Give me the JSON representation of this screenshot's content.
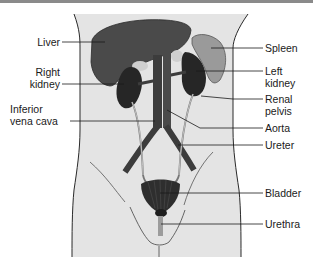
{
  "diagram": {
    "type": "anatomical-diagram",
    "colors": {
      "background": "#ffffff",
      "body_fill": "#e4e4e4",
      "outline": "#2a2a2a",
      "liver": "#4a4a4a",
      "kidney": "#262626",
      "spleen": "#9a9a9a",
      "vessel": "#3c3c3c",
      "bladder": "#2e2e2e",
      "urethra": "#9c9c9c",
      "leader_line": "#1a1a1a",
      "text": "#1a1a1a"
    },
    "labels": {
      "liver": "Liver",
      "right_kidney": "Right\nkidney",
      "inferior_vena_cava": "Inferior\nvena cava",
      "spleen": "Spleen",
      "left_kidney": "Left\nkidney",
      "renal_pelvis": "Renal\npelvis",
      "aorta": "Aorta",
      "ureter": "Ureter",
      "bladder": "Bladder",
      "urethra": "Urethra"
    }
  }
}
